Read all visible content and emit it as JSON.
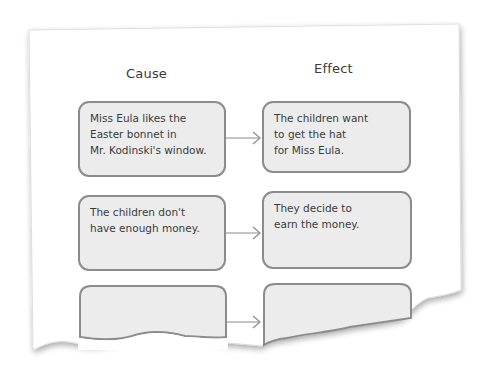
{
  "diagram": {
    "type": "cause-effect chart",
    "headers": {
      "cause": "Cause",
      "effect": "Effect"
    },
    "rows": [
      {
        "cause": [
          "Miss Eula likes the",
          "Easter bonnet in",
          "Mr. Kodinski's window."
        ],
        "effect": [
          "The children want",
          "to get the hat",
          "for Miss Eula."
        ]
      },
      {
        "cause": [
          "The children don't",
          "have enough money."
        ],
        "effect": [
          "They decide to",
          "earn the money."
        ]
      },
      {
        "cause": [],
        "effect": []
      }
    ],
    "colors": {
      "box_fill": "#ececec",
      "box_border": "#8c8c8c",
      "text": "#3b3b3b",
      "arrow": "#8c8c8c",
      "paper": "#ffffff"
    }
  }
}
